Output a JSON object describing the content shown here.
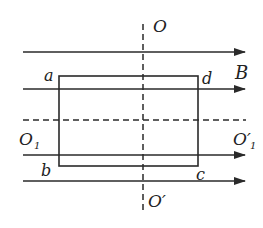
{
  "diagram": {
    "type": "physics-magnetic-field-coil",
    "colors": {
      "ink": "#2a2a2a",
      "background": "#ffffff"
    },
    "field_label": "B",
    "field_lines_y": [
      52,
      89,
      155,
      181
    ],
    "coil": {
      "corners": {
        "a": "a",
        "b": "b",
        "c": "c",
        "d": "d"
      },
      "rect": {
        "x": 59,
        "y": 76,
        "width": 139,
        "height": 90
      }
    },
    "axes": {
      "vertical": {
        "top_label": "O",
        "bottom_label": "O′",
        "x": 143
      },
      "horizontal": {
        "left_label": "O",
        "left_sub": "1",
        "right_label": "O′",
        "right_sub": "1",
        "y": 120
      }
    }
  }
}
